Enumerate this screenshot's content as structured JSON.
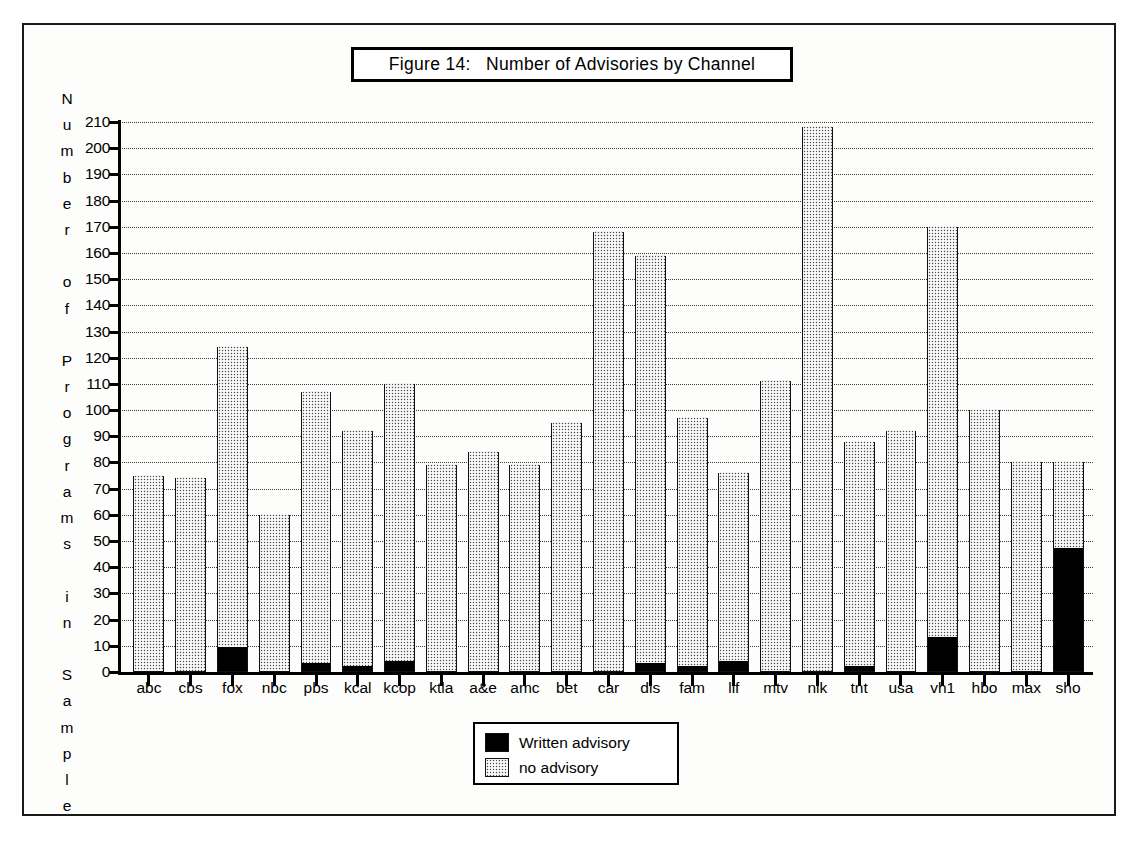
{
  "figure": {
    "title": "Figure 14:   Number of Advisories by Channel",
    "border_color": "#1a1a1a",
    "background": "#ffffff"
  },
  "axes": {
    "ylabel_text": "Number of Programs in Sample",
    "ylabel_chars": [
      "N",
      "u",
      "m",
      "b",
      "e",
      "r",
      "",
      "o",
      "f",
      "",
      "P",
      "r",
      "o",
      "g",
      "r",
      "a",
      "m",
      "s",
      "",
      "i",
      "n",
      "",
      "S",
      "a",
      "m",
      "p",
      "l",
      "e"
    ],
    "ytick_labels": [
      "210",
      "200",
      "190",
      "180",
      "170",
      "160",
      "150",
      "140",
      "130",
      "120",
      "110",
      "100",
      "90",
      "80",
      "70",
      "60",
      "50",
      "40",
      "30",
      "20",
      "10",
      "0"
    ]
  },
  "legend": {
    "items": [
      {
        "label": "Written advisory",
        "swatch": "black",
        "color": "#000000"
      },
      {
        "label": "no advisory",
        "swatch": "dotted",
        "color": "#4a4a4a"
      }
    ]
  },
  "chart_data": {
    "type": "bar",
    "title": "Figure 14:   Number of Advisories by Channel",
    "xlabel": "",
    "ylabel": "Number of Programs in Sample",
    "ylim": [
      0,
      210
    ],
    "ytick_step": 10,
    "grid": true,
    "stacked": true,
    "legend_position": "bottom-center",
    "categories": [
      "abc",
      "cbs",
      "fox",
      "nbc",
      "pbs",
      "kcal",
      "kcop",
      "ktla",
      "a&e",
      "amc",
      "bet",
      "car",
      "dis",
      "fam",
      "lif",
      "mtv",
      "nik",
      "tnt",
      "usa",
      "vh1",
      "hbo",
      "max",
      "sho"
    ],
    "series": [
      {
        "name": "Written advisory",
        "color": "#000000",
        "values": [
          0,
          0,
          9,
          0,
          3,
          2,
          4,
          0,
          0,
          0,
          0,
          0,
          3,
          2,
          4,
          0,
          0,
          2,
          0,
          13,
          0,
          0,
          47
        ]
      },
      {
        "name": "no advisory",
        "color": "#4a4a4a",
        "values": [
          75,
          74,
          115,
          60,
          104,
          90,
          106,
          79,
          84,
          79,
          95,
          168,
          156,
          95,
          72,
          111,
          208,
          86,
          92,
          157,
          100,
          80,
          33
        ]
      }
    ],
    "totals": [
      75,
      74,
      124,
      60,
      107,
      92,
      110,
      79,
      84,
      79,
      95,
      168,
      159,
      97,
      76,
      111,
      208,
      88,
      92,
      170,
      100,
      80,
      80
    ]
  }
}
